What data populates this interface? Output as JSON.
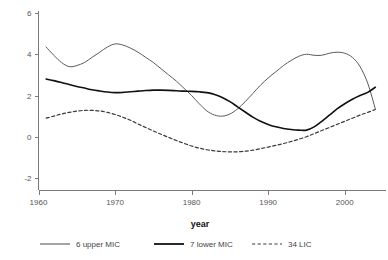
{
  "chart_data": {
    "type": "line",
    "title": "",
    "xlabel": "year",
    "ylabel": "",
    "xlim": [
      1960,
      2005
    ],
    "ylim": [
      -2,
      6
    ],
    "grid": false,
    "legend_position": "bottom",
    "x_ticks": [
      "1960",
      "1970",
      "1980",
      "1990",
      "2000"
    ],
    "x_tick_values": [
      1960,
      1970,
      1980,
      1990,
      2000
    ],
    "y_ticks": [
      "6",
      "4",
      "2",
      "0",
      "-2"
    ],
    "y_tick_values": [
      6,
      4,
      2,
      0,
      -2
    ],
    "series": [
      {
        "name": "6 upper MIC",
        "style": "solid-thin",
        "color": "#5a5a5a",
        "x": [
          1961,
          1962,
          1963,
          1964,
          1965,
          1966,
          1967,
          1968,
          1969,
          1970,
          1971,
          1972,
          1973,
          1974,
          1975,
          1976,
          1977,
          1978,
          1979,
          1980,
          1981,
          1982,
          1983,
          1984,
          1985,
          1986,
          1987,
          1988,
          1989,
          1990,
          1991,
          1992,
          1993,
          1994,
          1995,
          1996,
          1997,
          1998,
          1999,
          2000,
          2001,
          2002,
          2003,
          2004
        ],
        "values": [
          4.35,
          3.95,
          3.6,
          3.4,
          3.45,
          3.6,
          3.85,
          4.1,
          4.35,
          4.5,
          4.45,
          4.3,
          4.1,
          3.85,
          3.6,
          3.3,
          3.0,
          2.7,
          2.35,
          2.0,
          1.6,
          1.25,
          1.05,
          1.0,
          1.1,
          1.35,
          1.7,
          2.1,
          2.5,
          2.85,
          3.15,
          3.45,
          3.7,
          3.9,
          4.0,
          3.95,
          3.95,
          4.05,
          4.1,
          4.05,
          3.85,
          3.4,
          2.6,
          1.35
        ]
      },
      {
        "name": "7 lower MIC",
        "style": "solid-thick",
        "color": "#111111",
        "x": [
          1961,
          1962,
          1963,
          1964,
          1965,
          1966,
          1967,
          1968,
          1969,
          1970,
          1971,
          1972,
          1973,
          1974,
          1975,
          1976,
          1977,
          1978,
          1979,
          1980,
          1981,
          1982,
          1983,
          1984,
          1985,
          1986,
          1987,
          1988,
          1989,
          1990,
          1991,
          1992,
          1993,
          1994,
          1995,
          1996,
          1997,
          1998,
          1999,
          2000,
          2001,
          2002,
          2003,
          2004
        ],
        "values": [
          2.8,
          2.72,
          2.63,
          2.53,
          2.44,
          2.36,
          2.28,
          2.22,
          2.17,
          2.14,
          2.15,
          2.18,
          2.21,
          2.24,
          2.26,
          2.26,
          2.25,
          2.23,
          2.21,
          2.2,
          2.18,
          2.14,
          2.05,
          1.9,
          1.7,
          1.45,
          1.2,
          0.95,
          0.75,
          0.6,
          0.48,
          0.4,
          0.35,
          0.32,
          0.32,
          0.48,
          0.75,
          1.05,
          1.35,
          1.6,
          1.82,
          2.0,
          2.15,
          2.4
        ]
      },
      {
        "name": "34 LIC",
        "style": "dashed",
        "color": "#3a3a3a",
        "x": [
          1961,
          1962,
          1963,
          1964,
          1965,
          1966,
          1967,
          1968,
          1969,
          1970,
          1971,
          1972,
          1973,
          1974,
          1975,
          1976,
          1977,
          1978,
          1979,
          1980,
          1981,
          1982,
          1983,
          1984,
          1985,
          1986,
          1987,
          1988,
          1989,
          1990,
          1991,
          1992,
          1993,
          1994,
          1995,
          1996,
          1997,
          1998,
          1999,
          2000,
          2001,
          2002,
          2003,
          2004
        ],
        "values": [
          0.9,
          1.0,
          1.1,
          1.18,
          1.24,
          1.28,
          1.28,
          1.25,
          1.18,
          1.08,
          0.95,
          0.8,
          0.62,
          0.45,
          0.28,
          0.12,
          -0.03,
          -0.18,
          -0.32,
          -0.45,
          -0.55,
          -0.63,
          -0.68,
          -0.72,
          -0.73,
          -0.73,
          -0.7,
          -0.65,
          -0.58,
          -0.5,
          -0.42,
          -0.33,
          -0.23,
          -0.12,
          0.0,
          0.15,
          0.3,
          0.45,
          0.6,
          0.75,
          0.9,
          1.05,
          1.18,
          1.32
        ]
      }
    ]
  },
  "legend": {
    "items": [
      {
        "label": "6 upper MIC"
      },
      {
        "label": "7 lower MIC"
      },
      {
        "label": "34 LIC"
      }
    ]
  }
}
